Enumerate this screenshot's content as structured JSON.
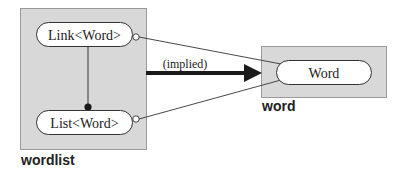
{
  "colors": {
    "group_fill": "#d8d8d8",
    "group_stroke": "#9a9a9a",
    "pill_fill": "#ffffff",
    "pill_stroke": "#333333",
    "line": "#333333",
    "arrow": "#1a1a1a",
    "text": "#222222"
  },
  "groups": [
    {
      "id": "wordlist",
      "label": "wordlist"
    },
    {
      "id": "word",
      "label": "word"
    }
  ],
  "nodes": [
    {
      "id": "link",
      "label": "Link<Word>",
      "group": "wordlist"
    },
    {
      "id": "list",
      "label": "List<Word>",
      "group": "wordlist"
    },
    {
      "id": "word",
      "label": "Word",
      "group": "word"
    }
  ],
  "edges": [
    {
      "from": "link",
      "to": "list",
      "style": "line with filled dot end"
    },
    {
      "from": "link",
      "to": "word",
      "style": "thin line with open circle start"
    },
    {
      "from": "list",
      "to": "word",
      "style": "thin line with open circle start"
    },
    {
      "from": "wordlist",
      "to": "word",
      "style": "thick arrow",
      "label": "(implied)"
    }
  ],
  "arrow_label": "(implied)"
}
